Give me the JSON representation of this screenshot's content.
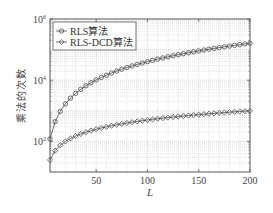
{
  "chart_data": {
    "type": "line",
    "title": "",
    "xlabel": "L",
    "ylabel": "乘法的次数",
    "xscale": "linear",
    "yscale": "log",
    "xlim": [
      5,
      200
    ],
    "ylim": [
      10,
      1000000
    ],
    "xticks": [
      50,
      100,
      150,
      200
    ],
    "xtick_labels": [
      "50",
      "100",
      "150",
      "200"
    ],
    "yticks": [
      100,
      10000,
      1000000
    ],
    "ytick_labels": [
      {
        "base": "10",
        "exp": "2"
      },
      {
        "base": "10",
        "exp": "4"
      },
      {
        "base": "10",
        "exp": "6"
      }
    ],
    "grid": true,
    "minor_grid": true,
    "legend_position": "upper left",
    "x": [
      5,
      10,
      15,
      20,
      25,
      30,
      35,
      40,
      45,
      50,
      55,
      60,
      65,
      70,
      75,
      80,
      85,
      90,
      95,
      100,
      105,
      110,
      115,
      120,
      125,
      130,
      135,
      140,
      145,
      150,
      155,
      160,
      165,
      170,
      175,
      180,
      185,
      190,
      195,
      200
    ],
    "series": [
      {
        "name": "RLS算法",
        "marker": "circle",
        "values": [
          120,
          440,
          960,
          1680,
          2600,
          3720,
          5040,
          6560,
          8280,
          10200,
          12320,
          14640,
          17160,
          19880,
          22800,
          25920,
          29240,
          32760,
          36480,
          40400,
          44520,
          48840,
          53360,
          58080,
          63000,
          68120,
          73440,
          78960,
          84680,
          90600,
          96720,
          103040,
          109560,
          116280,
          123200,
          130320,
          137640,
          145160,
          152880,
          160800
        ]
      },
      {
        "name": "RLS-DCD算法",
        "marker": "diamond",
        "values": [
          25,
          50,
          75,
          100,
          125,
          150,
          175,
          200,
          225,
          250,
          275,
          300,
          325,
          350,
          375,
          400,
          425,
          450,
          475,
          500,
          525,
          550,
          575,
          600,
          625,
          650,
          675,
          700,
          725,
          750,
          775,
          800,
          825,
          850,
          875,
          900,
          925,
          950,
          975,
          1000
        ]
      }
    ],
    "colors": {
      "line": "#4a4a4a",
      "frame": "#555555",
      "grid": "#c8c8c8",
      "legend_border": "#555555"
    }
  }
}
